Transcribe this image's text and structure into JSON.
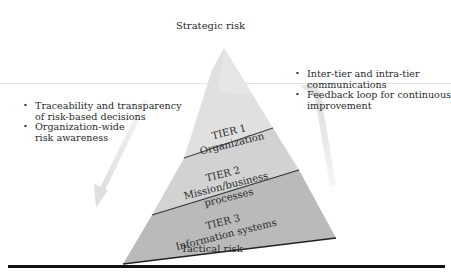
{
  "diagram": {
    "top_label": "Strategic risk",
    "bottom_label": "Tactical risk",
    "tiers": [
      {
        "title": "TIER 1",
        "lines": [
          "Organization"
        ],
        "fill": "#dcdcdc"
      },
      {
        "title": "TIER 2",
        "lines": [
          "Mission/business",
          "processes"
        ],
        "fill": "#cfcfcf"
      },
      {
        "title": "TIER 3",
        "lines": [
          "Information systems"
        ],
        "fill": "#b9b9b9"
      }
    ],
    "left_bullets": [
      "Traceability and transparency of risk-based decisions",
      "Organization-wide risk awareness"
    ],
    "left_bullet_lines": [
      [
        "Traceability and transparency",
        "of risk-based decisions"
      ],
      [
        "Organization-wide",
        "risk awareness"
      ]
    ],
    "right_bullet_lines": [
      [
        "Inter-tier and intra-tier",
        "communications"
      ],
      [
        "Feedback loop for continuous",
        "improvement"
      ]
    ],
    "arrows": {
      "left": "down",
      "right": "up"
    }
  }
}
